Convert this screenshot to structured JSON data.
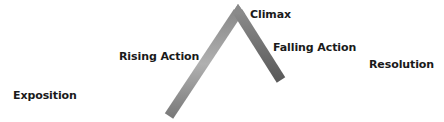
{
  "diagram": {
    "stages": [
      {
        "label": "Exposition"
      },
      {
        "label": "Rising Action"
      },
      {
        "label": "Climax"
      },
      {
        "label": "Falling Action"
      },
      {
        "label": "Resolution"
      }
    ],
    "colors": {
      "line_dark": "#555555",
      "line_light": "#aaaaaa",
      "text": "#1a1a1a"
    }
  }
}
